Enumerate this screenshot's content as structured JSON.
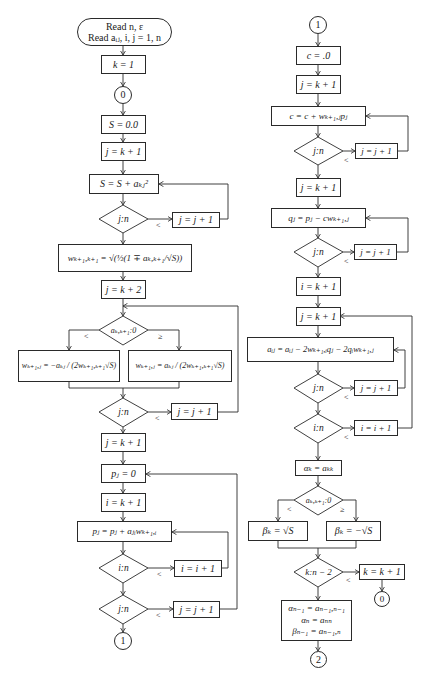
{
  "left": {
    "start": {
      "line1": "Read n, ε",
      "line2": "Read aᵢⱼ, i, j = 1, n"
    },
    "k_init": "k = 1",
    "connector_0": "0",
    "s_init": "S = 0.0",
    "j_init_1": "j = k + 1",
    "s_accum": "S = S + aₖⱼ²",
    "dec_jn_1": "j:n",
    "j_inc_1": "j = j + 1",
    "w_diag": "wₖ₊₁,ₖ₊₁ = √(½(1 ∓ aₖ,ₖ₊₁/√S))",
    "j_init_2": "j = k + 2",
    "dec_sign": "aₖ,ₖ₊₁:0",
    "branch_lt": "<",
    "branch_ge": "≥",
    "w_neg": "wₖ₊₁,ⱼ = −aₖⱼ / (2wₖ₊₁,ₖ₊₁√S)",
    "w_pos": "wₖ₊₁,ⱼ = aₖⱼ / (2wₖ₊₁,ₖ₊₁√S)",
    "dec_jn_2": "j:n",
    "j_inc_2": "j = j + 1",
    "j_init_3": "j = k + 1",
    "p_init": "pⱼ = 0",
    "i_init": "i = k + 1",
    "p_accum": "pⱼ = pⱼ + aⱼᵢwₖ₊₁,ᵢ",
    "dec_in": "i:n",
    "i_inc": "i = i + 1",
    "dec_jn_3": "j:n",
    "j_inc_3": "j = j + 1",
    "connector_1": "1",
    "lt": "<"
  },
  "right": {
    "connector_1": "1",
    "c_init": "c = .0",
    "j_init_1": "j = k + 1",
    "c_accum": "c = c + wₖ₊₁,ⱼpⱼ",
    "dec_jn_1": "j:n",
    "j_inc_1": "j = j + 1",
    "j_init_2": "j = k + 1",
    "q_calc": "qⱼ = pⱼ − cwₖ₊₁,ⱼ",
    "dec_jn_2": "j:n",
    "j_inc_2": "j = j + 1",
    "i_init": "i = k + 1",
    "j_init_3": "j = k + 1",
    "a_update": "aᵢⱼ = aᵢⱼ − 2wₖ₊₁,ᵢqⱼ − 2qᵢwₖ₊₁,ⱼ",
    "dec_jn_3": "j:n",
    "j_inc_3": "j = j + 1",
    "dec_in": "i:n",
    "i_inc": "i = i + 1",
    "alpha": "αₖ = aₖₖ",
    "dec_sign": "aₖ,ₖ₊₁:0",
    "branch_lt": "<",
    "branch_ge": "≥",
    "beta_pos": "βₖ = √S",
    "beta_neg": "βₖ = −√S",
    "dec_k": "k:n − 2",
    "k_inc": "k = k + 1",
    "connector_0": "0",
    "final_1": "αₙ₋₁ = aₙ₋₁,ₙ₋₁",
    "final_2": "αₙ = aₙₙ",
    "final_3": "βₙ₋₁ = aₙ₋₁,ₙ",
    "connector_2": "2",
    "lt": "<"
  }
}
